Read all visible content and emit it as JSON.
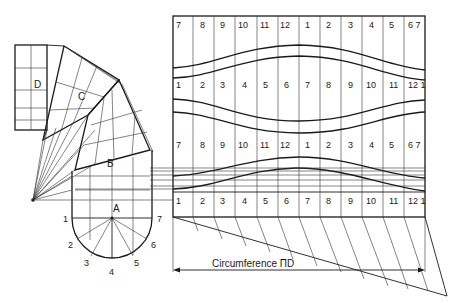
{
  "diagram": {
    "segments": [
      "A",
      "B",
      "C",
      "D"
    ],
    "profile_points": [
      "1",
      "2",
      "3",
      "4",
      "5",
      "6",
      "7"
    ],
    "rows": [
      {
        "name": "row-1",
        "labels": [
          "7",
          "8",
          "9",
          "10",
          "11",
          "12",
          "1",
          "2",
          "3",
          "4",
          "5",
          "6 7"
        ]
      },
      {
        "name": "row-2",
        "labels": [
          "1",
          "2",
          "3",
          "4",
          "5",
          "6",
          "7",
          "8",
          "9",
          "10",
          "11",
          "12 1"
        ]
      },
      {
        "name": "row-3",
        "labels": [
          "7",
          "8",
          "9",
          "10",
          "11",
          "12",
          "1",
          "2",
          "3",
          "4",
          "5",
          "6 7"
        ]
      },
      {
        "name": "row-4",
        "labels": [
          "1",
          "2",
          "3",
          "4",
          "5",
          "6",
          "7",
          "8",
          "9",
          "10",
          "11",
          "12 1"
        ]
      }
    ],
    "dimension_label": "Circumference ΠD"
  }
}
